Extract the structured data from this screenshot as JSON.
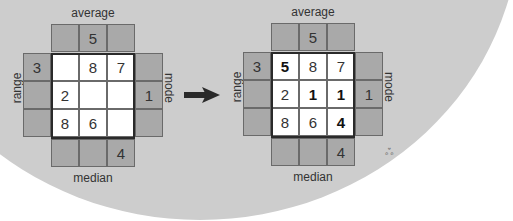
{
  "labels": {
    "top": "average",
    "bottom": "median",
    "left": "range",
    "right": "mode"
  },
  "puzzle_before": {
    "top_clues": [
      "",
      "5",
      ""
    ],
    "bottom_clues": [
      "",
      "",
      "4"
    ],
    "left_clues": [
      "3",
      "",
      ""
    ],
    "right_clues": [
      "",
      "1",
      ""
    ],
    "grid": [
      [
        "",
        "8",
        "7"
      ],
      [
        "2",
        "",
        ""
      ],
      [
        "8",
        "6",
        ""
      ]
    ]
  },
  "puzzle_after": {
    "top_clues": [
      "",
      "5",
      ""
    ],
    "bottom_clues": [
      "",
      "",
      "4"
    ],
    "left_clues": [
      "3",
      "",
      ""
    ],
    "right_clues": [
      "",
      "1",
      ""
    ],
    "grid": [
      [
        "5",
        "8",
        "7"
      ],
      [
        "2",
        "1",
        "1"
      ],
      [
        "8",
        "6",
        "4"
      ]
    ],
    "solved_cells": [
      [
        0,
        0
      ],
      [
        1,
        1
      ],
      [
        1,
        2
      ],
      [
        2,
        2
      ]
    ]
  },
  "arrow_icon": "right-arrow-icon",
  "colors": {
    "background": "#cdcdcd",
    "clue_cell": "#a9a9a9",
    "grid_cell": "#ffffff",
    "border": "#2a2a2a"
  }
}
